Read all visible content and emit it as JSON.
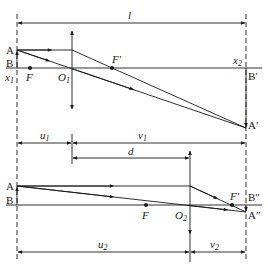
{
  "diagram": {
    "colors": {
      "line": "#1a1a1a",
      "background": "#ffffff"
    },
    "top": {
      "distance_label": "l",
      "object_top": "A",
      "object_bottom": "B",
      "object_pos": "x",
      "object_pos_sub": "1",
      "image_pos": "x",
      "image_pos_sub": "2",
      "focus_front": "F",
      "focus_back": "F′",
      "lens_center": "O",
      "lens_center_sub": "1",
      "image_bottom": "B′",
      "image_top": "A′"
    },
    "middle": {
      "u_label": "u",
      "u_sub": "1",
      "v_label": "v",
      "v_sub": "1",
      "d_label": "d"
    },
    "bottom": {
      "object_top": "A",
      "object_bottom": "B",
      "focus_front": "F",
      "focus_back": "F′",
      "lens_center": "O",
      "lens_center_sub": "2",
      "image_bottom": "B″",
      "image_top": "A″",
      "u_label": "u",
      "u_sub": "2",
      "v_label": "v",
      "v_sub": "2"
    }
  }
}
